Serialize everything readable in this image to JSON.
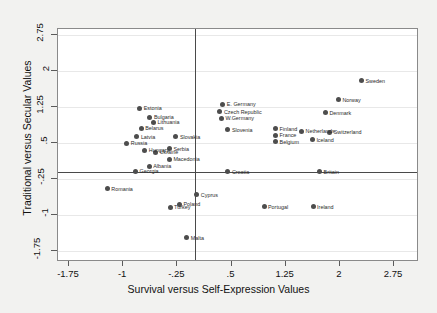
{
  "chart_data": {
    "type": "scatter",
    "title": "",
    "xlabel": "Survival versus Self-Expression Values",
    "ylabel": "Traditional versus Secular Values",
    "xlim": [
      -2.1,
      3.05
    ],
    "ylim": [
      -2.05,
      3.05
    ],
    "xticks": [
      "-1.75",
      "-1",
      "-.25",
      ".5",
      "1.25",
      "2",
      "2.75"
    ],
    "xtickvalues": [
      -1.75,
      -1,
      -0.25,
      0.5,
      1.25,
      2,
      2.75
    ],
    "yticks": [
      "2.75",
      "2",
      "1.25",
      ".5",
      "-.25",
      "-1",
      "-1.75"
    ],
    "ytickvalues": [
      2.75,
      2,
      1.25,
      0.5,
      -0.25,
      -1,
      -1.75
    ],
    "grid": true,
    "legend": "none",
    "marker_color": "#4d4d4d",
    "reference_lines": {
      "vertical_x": 0.0,
      "horizontal_y": -0.1
    },
    "points": [
      {
        "label": "Sweden",
        "x": 2.3,
        "y": 1.8
      },
      {
        "label": "Norway",
        "x": 1.98,
        "y": 1.4
      },
      {
        "label": "Denmark",
        "x": 1.8,
        "y": 1.13
      },
      {
        "label": "Switzerland",
        "x": 1.86,
        "y": 0.72
      },
      {
        "label": "Netherlands",
        "x": 1.47,
        "y": 0.74
      },
      {
        "label": "Iceland",
        "x": 1.62,
        "y": 0.57
      },
      {
        "label": "Britain",
        "x": 1.72,
        "y": -0.1
      },
      {
        "label": "Ireland",
        "x": 1.63,
        "y": -0.83
      },
      {
        "label": "Finland",
        "x": 1.11,
        "y": 0.8
      },
      {
        "label": "France",
        "x": 1.11,
        "y": 0.66
      },
      {
        "label": "Belgium",
        "x": 1.11,
        "y": 0.53
      },
      {
        "label": "Portugal",
        "x": 0.95,
        "y": -0.83
      },
      {
        "label": "Slovenia",
        "x": 0.45,
        "y": 0.78
      },
      {
        "label": "Croatia",
        "x": 0.45,
        "y": -0.1
      },
      {
        "label": "W.Germany",
        "x": 0.36,
        "y": 1.02
      },
      {
        "label": "Czech Republic",
        "x": 0.34,
        "y": 1.15
      },
      {
        "label": "E. Germany",
        "x": 0.38,
        "y": 1.31
      },
      {
        "label": "Cyprus",
        "x": 0.02,
        "y": -0.58
      },
      {
        "label": "Poland",
        "x": -0.22,
        "y": -0.78
      },
      {
        "label": "Malta",
        "x": -0.12,
        "y": -1.47
      },
      {
        "label": "Turkey",
        "x": -0.35,
        "y": -0.84
      },
      {
        "label": "Slovakia",
        "x": -0.27,
        "y": 0.63
      },
      {
        "label": "Serbia",
        "x": -0.36,
        "y": 0.38
      },
      {
        "label": "Macedonia",
        "x": -0.36,
        "y": 0.16
      },
      {
        "label": "Ukraine",
        "x": -0.55,
        "y": 0.31
      },
      {
        "label": "Hungary",
        "x": -0.7,
        "y": 0.35
      },
      {
        "label": "Albania",
        "x": -0.64,
        "y": 0.02
      },
      {
        "label": "Georgia",
        "x": -0.83,
        "y": -0.09
      },
      {
        "label": "Russia",
        "x": -0.95,
        "y": 0.5
      },
      {
        "label": "Latvia",
        "x": -0.81,
        "y": 0.63
      },
      {
        "label": "Belarus",
        "x": -0.75,
        "y": 0.81
      },
      {
        "label": "Lithuania",
        "x": -0.58,
        "y": 0.93
      },
      {
        "label": "Bulgaria",
        "x": -0.63,
        "y": 1.04
      },
      {
        "label": "Estonia",
        "x": -0.77,
        "y": 1.22
      },
      {
        "label": "Romania",
        "x": -1.22,
        "y": -0.45
      }
    ]
  }
}
